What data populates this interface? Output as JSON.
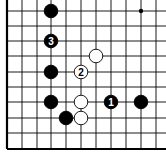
{
  "diagram": {
    "type": "go-board-corner",
    "board_edges": [
      "left",
      "bottom"
    ],
    "colors": {
      "background": "#ffffff",
      "line": "#000000",
      "black_stone": "#000000",
      "white_stone": "#ffffff"
    },
    "grid": {
      "columns_x": [
        7,
        22,
        37,
        51,
        66,
        81,
        96,
        111,
        126,
        141,
        156
      ],
      "rows_y": [
        11,
        26,
        41,
        56,
        72,
        87,
        102,
        118,
        133,
        149
      ]
    },
    "star_point": {
      "col": 9,
      "row": 0
    },
    "stones": [
      {
        "color": "black",
        "col": 3,
        "row": 0,
        "label": ""
      },
      {
        "color": "black",
        "col": 3,
        "row": 2,
        "label": "3"
      },
      {
        "color": "white",
        "col": 6,
        "row": 3,
        "label": ""
      },
      {
        "color": "black",
        "col": 3,
        "row": 4,
        "label": ""
      },
      {
        "color": "white",
        "col": 5,
        "row": 4,
        "label": "2"
      },
      {
        "color": "black",
        "col": 3,
        "row": 6,
        "label": ""
      },
      {
        "color": "white",
        "col": 5,
        "row": 6,
        "label": ""
      },
      {
        "color": "black",
        "col": 7,
        "row": 6,
        "label": "1"
      },
      {
        "color": "black",
        "col": 9,
        "row": 6,
        "label": ""
      },
      {
        "color": "black",
        "col": 4,
        "row": 7,
        "label": ""
      },
      {
        "color": "white",
        "col": 5,
        "row": 7,
        "label": ""
      }
    ]
  }
}
